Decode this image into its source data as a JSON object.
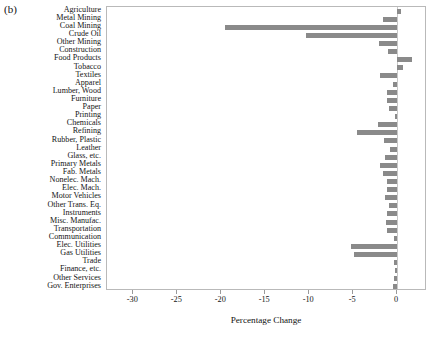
{
  "figure": {
    "panel_label": "(b)"
  },
  "axis": {
    "x_title": "Percentage Change",
    "x_ticks": [
      -30,
      -25,
      -20,
      -15,
      -10,
      -5,
      0
    ],
    "x_tick_labels": [
      "-30",
      "-25",
      "-20",
      "-15",
      "-10",
      "-5",
      "0"
    ],
    "x_min": -33.0,
    "x_max": 3.4
  },
  "style": {
    "bar_color": "#8a8a8a",
    "frame_color": "#b9b9b9",
    "zero_line_color": "#c8c8c8",
    "background": "#ffffff"
  },
  "chart_data": {
    "type": "bar",
    "orientation": "horizontal",
    "title": "(b)",
    "xlabel": "Percentage Change",
    "ylabel": "",
    "xlim": [
      -33.0,
      3.4
    ],
    "grid": false,
    "legend": null,
    "categories": [
      "Agriculture",
      "Metal Mining",
      "Coal Mining",
      "Crude Oil",
      "Other Mining",
      "Construction",
      "Food Products",
      "Tobacco",
      "Textiles",
      "Apparel",
      "Lumber, Wood",
      "Furniture",
      "Paper",
      "Printing",
      "Chemicals",
      "Refining",
      "Rubber, Plastic",
      "Leather",
      "Glass, etc.",
      "Primary Metals",
      "Fab. Metals",
      "Nonelec. Mach.",
      "Elec. Mach.",
      "Motor Vehicles",
      "Other Trans. Eq.",
      "Instruments",
      "Misc. Manufac.",
      "Transportation",
      "Communication",
      "Elec. Utilities",
      "Gas Utilities",
      "Trade",
      "Finance, etc.",
      "Other Services",
      "Gov. Enterprises"
    ],
    "values": [
      0.4,
      -1.6,
      -19.6,
      -10.4,
      -2.1,
      -1.0,
      1.7,
      0.7,
      -1.9,
      -0.5,
      -1.2,
      -1.2,
      -0.9,
      -0.2,
      -2.2,
      -4.6,
      -1.5,
      -0.8,
      -1.4,
      -2.0,
      -1.6,
      -1.2,
      -1.1,
      -1.4,
      -0.9,
      -1.1,
      -1.3,
      -1.2,
      -0.4,
      -5.3,
      -4.9,
      -0.4,
      -0.2,
      -0.3,
      -0.5
    ]
  }
}
